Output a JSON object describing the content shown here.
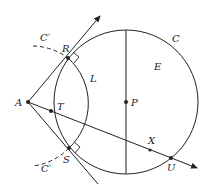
{
  "diagram": {
    "colors": {
      "stroke": "#222222",
      "background": "#ffffff"
    },
    "labels": {
      "A": "A",
      "R": "R",
      "S": "S",
      "T": "T",
      "P": "P",
      "X": "X",
      "U": "U",
      "L": "L",
      "E": "E",
      "C": "C",
      "C_prime_top": "C′",
      "C_prime_bottom": "C′"
    },
    "points": {
      "A": [
        28,
        102
      ],
      "R": [
        68,
        58
      ],
      "S": [
        69,
        148
      ],
      "T": [
        51,
        111
      ],
      "P": [
        126,
        102
      ],
      "X": [
        150,
        150
      ],
      "U": [
        171,
        158
      ]
    },
    "circle_C": {
      "center": [
        126,
        102
      ],
      "radius": 72
    },
    "circle_C_prime": {
      "center": [
        28,
        102
      ],
      "radius": 61
    }
  }
}
